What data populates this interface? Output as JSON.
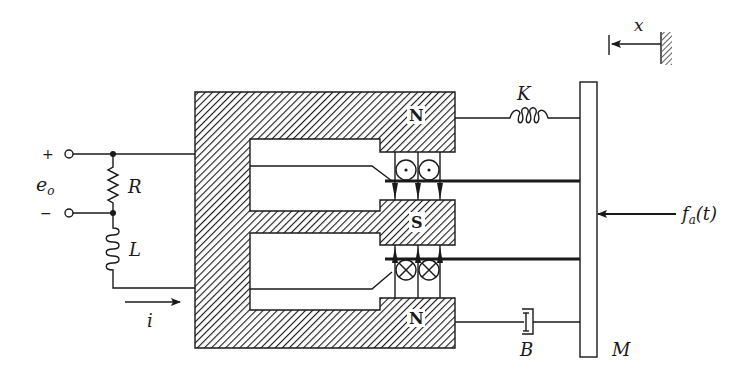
{
  "diagram": {
    "colors": {
      "ink": "#1a1a1a",
      "background": "#ffffff"
    },
    "circuit": {
      "terminal_plus": "+",
      "terminal_minus": "−",
      "voltage_label_base": "e",
      "voltage_label_sub": "o",
      "resistor_label": "R",
      "inductor_label": "L",
      "current_label": "i"
    },
    "magnet": {
      "top_pole": "N",
      "middle_pole": "S",
      "bottom_pole": "N"
    },
    "mechanical": {
      "spring_label": "K",
      "damper_label": "B",
      "mass_label": "M",
      "force_label_base": "f",
      "force_label_sub": "a",
      "force_label_arg": "(t)",
      "displacement_label": "x"
    }
  }
}
